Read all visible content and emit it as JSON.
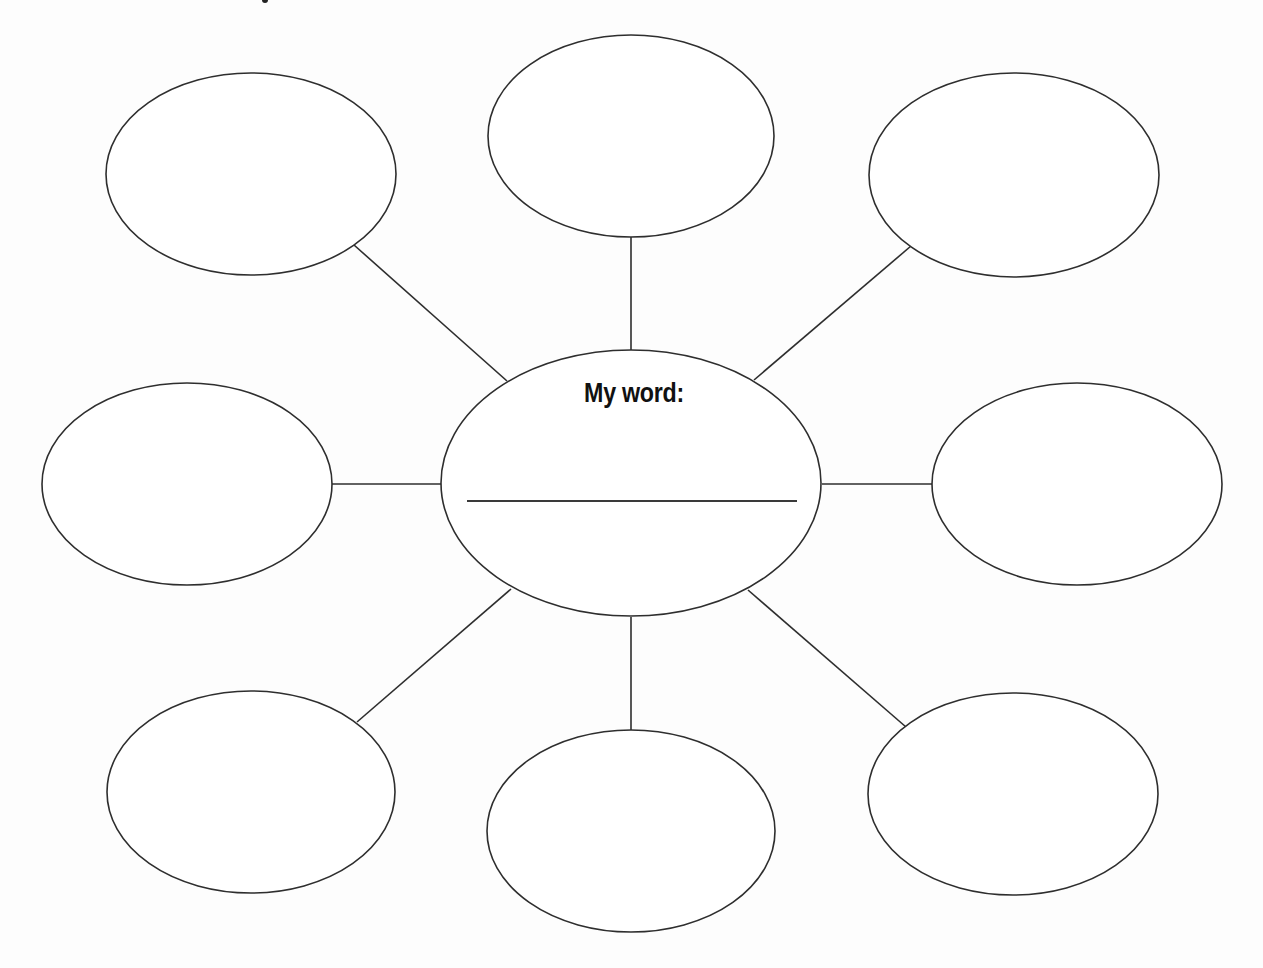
{
  "diagram": {
    "type": "concept-web",
    "center": {
      "label": "My word:",
      "answer_value": "",
      "ellipse": {
        "cx": 631,
        "cy": 483,
        "rx": 190,
        "ry": 133
      },
      "answer_line": {
        "x1": 467,
        "y1": 501,
        "x2": 797,
        "y2": 501
      }
    },
    "bubbles": [
      {
        "id": "top-left",
        "text": "",
        "cx": 251,
        "cy": 174,
        "rx": 145,
        "ry": 101
      },
      {
        "id": "top-center",
        "text": "",
        "cx": 631,
        "cy": 136,
        "rx": 143,
        "ry": 101
      },
      {
        "id": "top-right",
        "text": "",
        "cx": 1014,
        "cy": 175,
        "rx": 145,
        "ry": 102
      },
      {
        "id": "middle-left",
        "text": "",
        "cx": 187,
        "cy": 484,
        "rx": 145,
        "ry": 101
      },
      {
        "id": "middle-right",
        "text": "",
        "cx": 1077,
        "cy": 484,
        "rx": 145,
        "ry": 101
      },
      {
        "id": "bottom-left",
        "text": "",
        "cx": 251,
        "cy": 792,
        "rx": 144,
        "ry": 101
      },
      {
        "id": "bottom-center",
        "text": "",
        "cx": 631,
        "cy": 831,
        "rx": 144,
        "ry": 101
      },
      {
        "id": "bottom-right",
        "text": "",
        "cx": 1013,
        "cy": 794,
        "rx": 145,
        "ry": 101
      }
    ],
    "connectors": [
      {
        "to": "top-left",
        "x1": 507,
        "y1": 381,
        "x2": 354,
        "y2": 245
      },
      {
        "to": "top-center",
        "x1": 631,
        "y1": 350,
        "x2": 631,
        "y2": 237
      },
      {
        "to": "top-right",
        "x1": 754,
        "y1": 380,
        "x2": 911,
        "y2": 246
      },
      {
        "to": "middle-left",
        "x1": 441,
        "y1": 484,
        "x2": 332,
        "y2": 484
      },
      {
        "to": "middle-right",
        "x1": 822,
        "y1": 484,
        "x2": 932,
        "y2": 484
      },
      {
        "to": "bottom-left",
        "x1": 511,
        "y1": 589,
        "x2": 357,
        "y2": 722
      },
      {
        "to": "bottom-center",
        "x1": 631,
        "y1": 617,
        "x2": 631,
        "y2": 730
      },
      {
        "to": "bottom-right",
        "x1": 748,
        "y1": 590,
        "x2": 906,
        "y2": 727
      }
    ]
  }
}
